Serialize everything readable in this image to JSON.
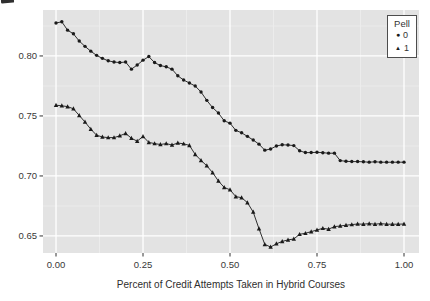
{
  "page": {
    "background": "#ffffff"
  },
  "chart_data": {
    "type": "line",
    "title": "",
    "xlabel": "Percent of Credit Attempts Taken in Hybrid Courses",
    "ylabel": "",
    "xlim": [
      -0.0374,
      1.0431
    ],
    "ylim": [
      0.6358,
      0.8383
    ],
    "grid": true,
    "panel_bg": "#e3e3e3",
    "grid_major_color": "#ffffff",
    "grid_minor_color": "#efefef",
    "tick_color": "#333333",
    "series_color": "#1a1a1a",
    "x_ticks": {
      "values": [
        0,
        0.25,
        0.5,
        0.75,
        1
      ],
      "labels": [
        "0.00",
        "0.25",
        "0.50",
        "0.75",
        "1.00"
      ]
    },
    "y_ticks": {
      "values": [
        0.8,
        0.75,
        0.7,
        0.65
      ],
      "labels": [
        "0.80",
        "0.75",
        "0.70",
        "0.65"
      ]
    },
    "x_minor": [
      0.125,
      0.375,
      0.625,
      0.875
    ],
    "y_minor": [
      0.675,
      0.725,
      0.775,
      0.825
    ],
    "legend": {
      "title": "Pell",
      "position": "top-right-inside",
      "items": [
        {
          "label": "0",
          "marker": "circle",
          "glyph": "●"
        },
        {
          "label": "1",
          "marker": "triangle",
          "glyph": "▲"
        }
      ]
    },
    "x": [
      0,
      0.0167,
      0.0333,
      0.05,
      0.0667,
      0.0833,
      0.1,
      0.1167,
      0.1333,
      0.15,
      0.1667,
      0.1833,
      0.2,
      0.2167,
      0.2333,
      0.25,
      0.2667,
      0.2833,
      0.3,
      0.3167,
      0.3333,
      0.35,
      0.3667,
      0.3833,
      0.4,
      0.4167,
      0.4333,
      0.45,
      0.4667,
      0.4833,
      0.5,
      0.5167,
      0.5333,
      0.55,
      0.5667,
      0.5833,
      0.6,
      0.6167,
      0.6333,
      0.65,
      0.6667,
      0.6833,
      0.7,
      0.7167,
      0.7333,
      0.75,
      0.7667,
      0.7833,
      0.8,
      0.8167,
      0.8333,
      0.85,
      0.8667,
      0.8833,
      0.9,
      0.9167,
      0.9333,
      0.95,
      0.9667,
      0.9833,
      1
    ],
    "series": [
      {
        "name": "0",
        "marker": "circle",
        "y": [
          0.8275,
          0.8285,
          0.8215,
          0.8185,
          0.8125,
          0.808,
          0.804,
          0.8005,
          0.798,
          0.796,
          0.795,
          0.7945,
          0.795,
          0.789,
          0.7925,
          0.7965,
          0.7995,
          0.7945,
          0.792,
          0.791,
          0.789,
          0.7835,
          0.78,
          0.7775,
          0.775,
          0.77,
          0.763,
          0.757,
          0.7525,
          0.746,
          0.744,
          0.738,
          0.736,
          0.733,
          0.73,
          0.7265,
          0.7215,
          0.7225,
          0.725,
          0.726,
          0.7258,
          0.7253,
          0.721,
          0.7195,
          0.7195,
          0.7197,
          0.7194,
          0.719,
          0.719,
          0.7128,
          0.7122,
          0.712,
          0.712,
          0.7118,
          0.7115,
          0.7118,
          0.7115,
          0.7115,
          0.7115,
          0.7115,
          0.7115
        ]
      },
      {
        "name": "1",
        "marker": "triangle",
        "y": [
          0.759,
          0.7585,
          0.7578,
          0.756,
          0.7505,
          0.745,
          0.739,
          0.734,
          0.7325,
          0.732,
          0.732,
          0.7335,
          0.7355,
          0.7315,
          0.729,
          0.733,
          0.728,
          0.727,
          0.7262,
          0.727,
          0.7258,
          0.7275,
          0.7268,
          0.7255,
          0.718,
          0.713,
          0.7085,
          0.7028,
          0.6958,
          0.6905,
          0.6885,
          0.6828,
          0.6819,
          0.6778,
          0.67,
          0.656,
          0.643,
          0.6408,
          0.6435,
          0.6455,
          0.6467,
          0.6475,
          0.6514,
          0.6522,
          0.6536,
          0.655,
          0.6564,
          0.6556,
          0.6578,
          0.6583,
          0.659,
          0.6595,
          0.66,
          0.6598,
          0.6603,
          0.6598,
          0.6603,
          0.6598,
          0.6598,
          0.6598,
          0.66
        ]
      }
    ]
  }
}
